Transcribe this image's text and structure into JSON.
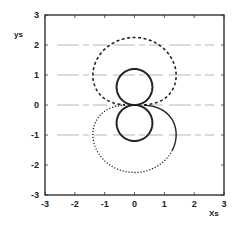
{
  "chart_data": {
    "type": "line",
    "title": "",
    "xlabel": "Xs",
    "ylabel": "ys",
    "xlim": [
      -3,
      3
    ],
    "ylim": [
      -3,
      3
    ],
    "xticks": [
      -3,
      -2,
      -1,
      0,
      1,
      2,
      3
    ],
    "yticks": [
      -3,
      -2,
      -1,
      0,
      1,
      2,
      3
    ],
    "grid": {
      "horizontal_lines_at": [
        2,
        1,
        0,
        -1
      ],
      "style": "faint broken"
    },
    "legend": null,
    "series": [
      {
        "name": "outer-upper-lobe",
        "style": "dashed",
        "description": "polar curve r = 2.25*sqrt(|sin(theta)|), theta in [0, pi]",
        "extent": {
          "xmin": -1.45,
          "xmax": 1.45,
          "ymax": 2.25
        },
        "points": [
          [
            2.25,
            0
          ],
          [
            1.5,
            0.35
          ],
          [
            1.42,
            0.99
          ],
          [
            1.1,
            1.75
          ],
          [
            0.6,
            2.14
          ],
          [
            0,
            2.25
          ],
          [
            -0.6,
            2.14
          ],
          [
            -1.1,
            1.75
          ],
          [
            -1.42,
            0.99
          ],
          [
            -1.5,
            0.35
          ],
          [
            -2.25,
            0
          ]
        ]
      },
      {
        "name": "outer-lower-lobe",
        "style": "dotted (solid in lower-right)",
        "description": "polar curve r = 2.25*sqrt(|sin(theta)|), theta in [pi, 2pi]",
        "extent": {
          "xmin": -1.45,
          "xmax": 1.45,
          "ymin": -2.27
        },
        "points": [
          [
            -2.25,
            0
          ],
          [
            -1.5,
            -0.35
          ],
          [
            -1.42,
            -0.99
          ],
          [
            -1.1,
            -1.75
          ],
          [
            -0.6,
            -2.14
          ],
          [
            0,
            -2.25
          ],
          [
            0.6,
            -2.14
          ],
          [
            1.1,
            -1.75
          ],
          [
            1.42,
            -0.99
          ],
          [
            1.5,
            -0.35
          ],
          [
            2.25,
            0
          ]
        ]
      },
      {
        "name": "inner-figure-eight",
        "style": "solid",
        "description": "polar curve r = 1.2*|sin(theta)| (two circles radius 0.6 centered at (0, +/-0.6))",
        "extent": {
          "xmin": -0.6,
          "xmax": 0.6,
          "ymin": -1.2,
          "ymax": 1.2
        },
        "points": [
          [
            0,
            0
          ],
          [
            0.42,
            0.18
          ],
          [
            0.6,
            0.6
          ],
          [
            0.42,
            1.02
          ],
          [
            0,
            1.2
          ],
          [
            -0.42,
            1.02
          ],
          [
            -0.6,
            0.6
          ],
          [
            -0.42,
            0.18
          ],
          [
            0,
            0
          ],
          [
            0.42,
            -0.18
          ],
          [
            0.6,
            -0.6
          ],
          [
            0.42,
            -1.02
          ],
          [
            0,
            -1.2
          ],
          [
            -0.42,
            -1.02
          ],
          [
            -0.6,
            -0.6
          ],
          [
            -0.42,
            -0.18
          ],
          [
            0,
            0
          ]
        ]
      }
    ]
  },
  "layout": {
    "plot_box": {
      "left": 45,
      "top": 15,
      "right": 224,
      "bottom": 195
    },
    "colors": {
      "axis": "#333333",
      "curve": "#222222",
      "grid": "#9a9a9a"
    },
    "outer": {
      "a": 2.25,
      "exponent": 0.5
    },
    "inner": {
      "a": 1.2
    }
  }
}
